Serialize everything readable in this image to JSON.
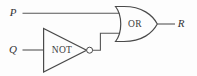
{
  "diagram": {
    "kind": "logic-circuit",
    "background_color": "#fdfdfd",
    "line_color": "#565656",
    "gate_stroke_color": "#4a4a4a",
    "text_color": "#333333",
    "width": 197,
    "height": 76,
    "inputs": [
      {
        "id": "P",
        "label": "P",
        "x": 13,
        "y": 13
      },
      {
        "id": "Q",
        "label": "Q",
        "x": 13,
        "y": 50
      }
    ],
    "outputs": [
      {
        "id": "R",
        "label": "R",
        "x": 181,
        "y": 24
      }
    ],
    "gates": [
      {
        "id": "not-gate",
        "type": "NOT",
        "label": "NOT",
        "label_x": 62,
        "label_y": 50,
        "inverted": true
      },
      {
        "id": "or-gate",
        "type": "OR",
        "label": "OR",
        "label_x": 135,
        "label_y": 24,
        "inverted": false
      }
    ],
    "expression": "R = P OR (NOT Q)"
  }
}
